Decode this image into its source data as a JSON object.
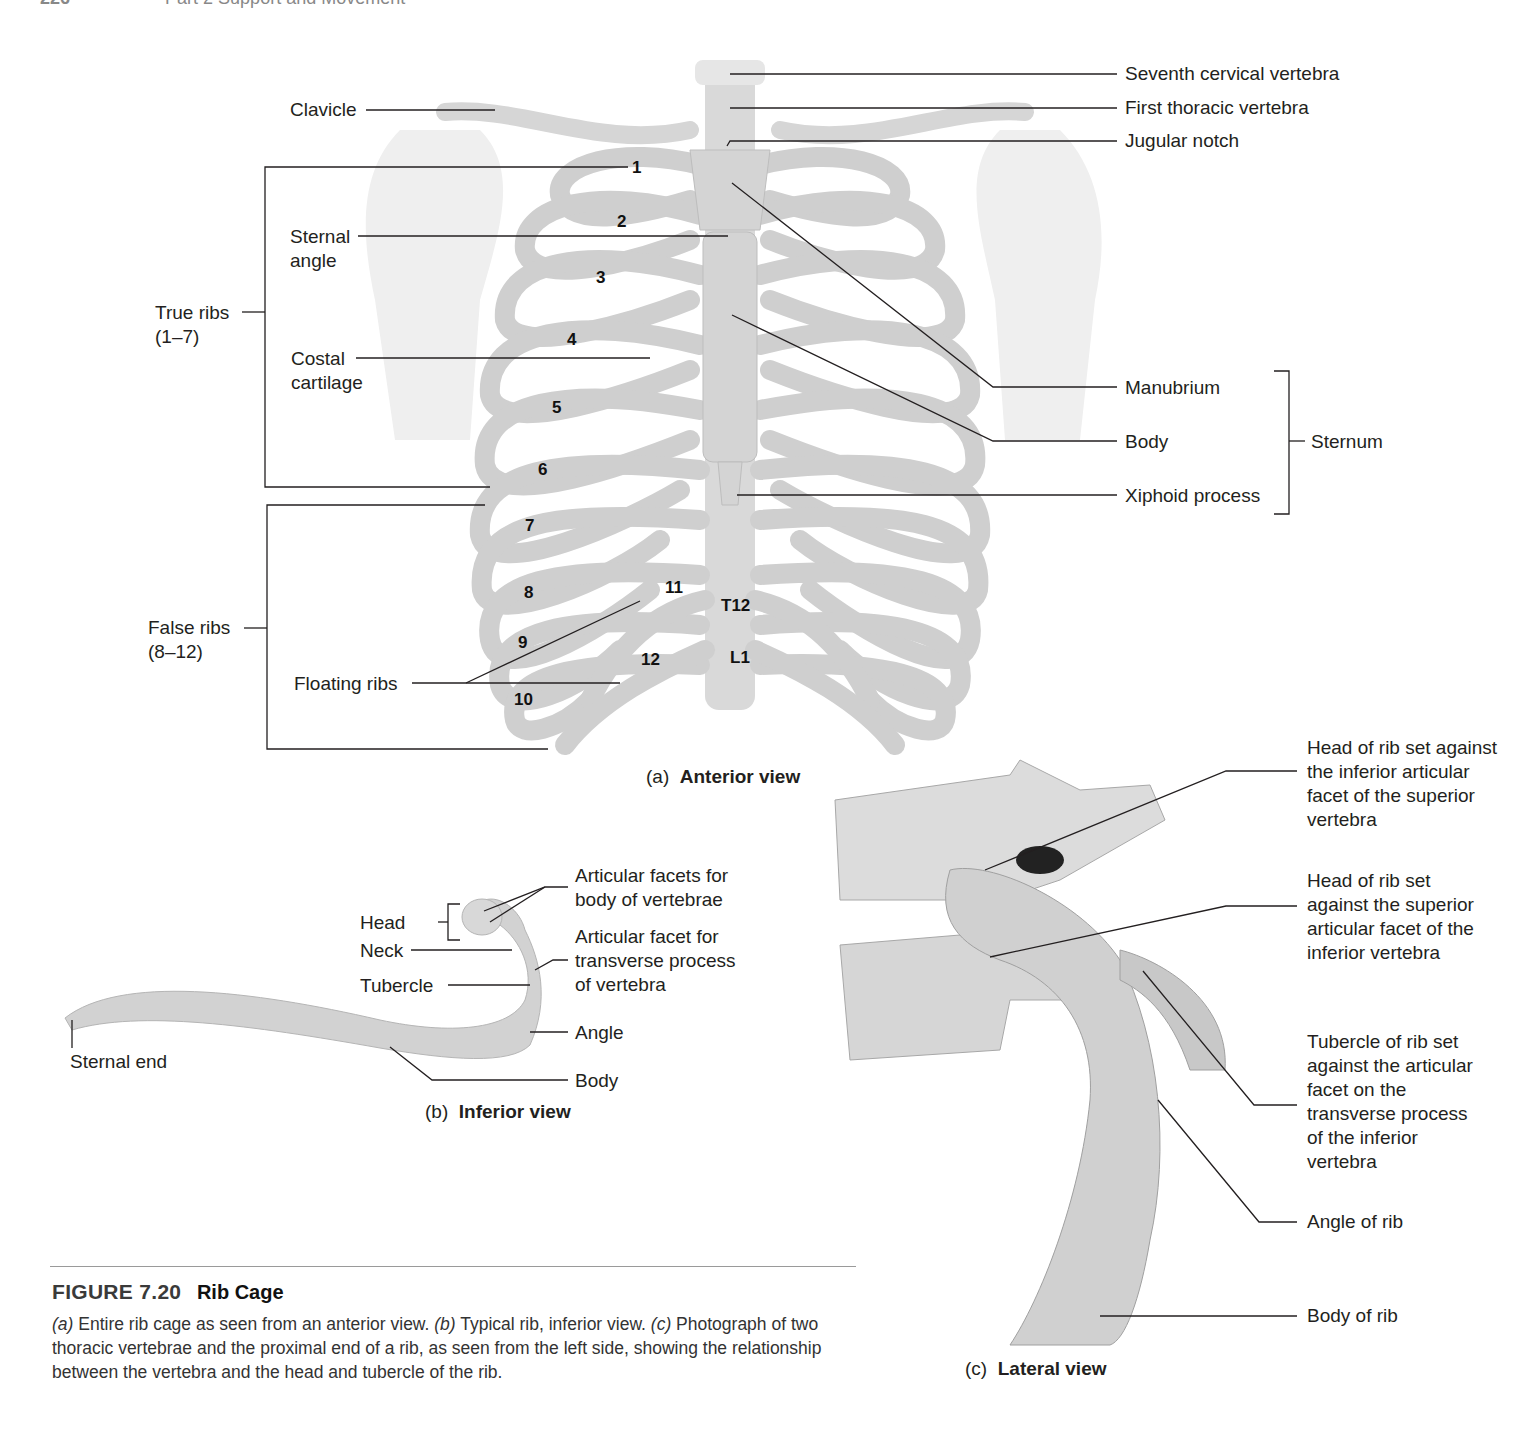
{
  "header": {
    "page_number": "226",
    "running_head": "Part 2  Support and Movement"
  },
  "panel_a": {
    "caption_letter": "(a)",
    "caption_title": "Anterior view",
    "labels_left": {
      "clavicle": "Clavicle",
      "sternal_angle_1": "Sternal",
      "sternal_angle_2": "angle",
      "true_ribs_1": "True ribs",
      "true_ribs_2": "(1–7)",
      "costal_cartilage_1": "Costal",
      "costal_cartilage_2": "cartilage",
      "false_ribs_1": "False ribs",
      "false_ribs_2": "(8–12)",
      "floating_ribs": "Floating ribs"
    },
    "labels_right": {
      "seventh_cervical": "Seventh cervical vertebra",
      "first_thoracic": "First thoracic vertebra",
      "jugular_notch": "Jugular notch",
      "manubrium": "Manubrium",
      "body": "Body",
      "xiphoid": "Xiphoid process",
      "sternum": "Sternum"
    },
    "rib_numbers": [
      "1",
      "2",
      "3",
      "4",
      "5",
      "6",
      "7",
      "8",
      "9",
      "10",
      "11",
      "12"
    ],
    "vertebra_labels": {
      "t12": "T12",
      "l1": "L1"
    }
  },
  "panel_b": {
    "caption_letter": "(b)",
    "caption_title": "Inferior view",
    "labels": {
      "head": "Head",
      "neck": "Neck",
      "tubercle": "Tubercle",
      "sternal_end": "Sternal end",
      "facets_body_1": "Articular facets for",
      "facets_body_2": "body of vertebrae",
      "facet_transverse_1": "Articular facet for",
      "facet_transverse_2": "transverse process",
      "facet_transverse_3": "of vertebra",
      "angle": "Angle",
      "body": "Body"
    }
  },
  "panel_c": {
    "caption_letter": "(c)",
    "caption_title": "Lateral view",
    "labels": {
      "head_inferior_facet": "Head of rib set against the inferior articular facet of the superior vertebra",
      "head_superior_facet": "Head of rib set against the superior articular facet of the inferior vertebra",
      "tubercle": "Tubercle of rib set against the articular facet on the transverse process of the inferior vertebra",
      "angle": "Angle of rib",
      "body": "Body of rib"
    }
  },
  "figure": {
    "number": "FIGURE 7.20",
    "title": "Rib Cage",
    "caption_a_letter": "(a)",
    "caption_a": " Entire rib cage as seen from an anterior view. ",
    "caption_b_letter": "(b)",
    "caption_b": " Typical rib, inferior view. ",
    "caption_c_letter": "(c)",
    "caption_c": " Photograph of two thoracic vertebrae and the proximal end of a rib, as seen from the left side, showing the relationship between the vertebra and the head and tubercle of the rib."
  }
}
